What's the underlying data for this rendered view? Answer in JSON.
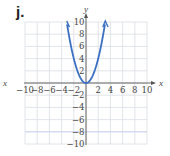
{
  "problem_label": "j.",
  "chart_data": {
    "type": "line",
    "title": "",
    "function": "y = x^2",
    "xlabel": "x",
    "ylabel": "y",
    "xlim": [
      -10,
      10
    ],
    "ylim": [
      -10,
      10
    ],
    "grid": true,
    "x_ticks": [
      -10,
      -8,
      -6,
      -4,
      -2,
      2,
      4,
      6,
      8,
      10
    ],
    "y_ticks": [
      -10,
      -8,
      -6,
      -4,
      -2,
      2,
      4,
      6,
      8,
      10
    ],
    "x_tick_labels": [
      "−10",
      "−8",
      "−6",
      "−4",
      "−2",
      "2",
      "4",
      "6",
      "8",
      "10"
    ],
    "y_tick_labels": [
      "−10",
      "−8",
      "−6",
      "−4",
      "−2",
      "2",
      "4",
      "6",
      "8",
      "10"
    ],
    "series": [
      {
        "name": "parabola",
        "color": "#3a6fc4",
        "x": [
          -3.16,
          -3,
          -2.5,
          -2,
          -1.5,
          -1,
          -0.5,
          0,
          0.5,
          1,
          1.5,
          2,
          2.5,
          3,
          3.16
        ],
        "y": [
          10,
          9,
          6.25,
          4,
          2.25,
          1,
          0.25,
          0,
          0.25,
          1,
          2.25,
          4,
          6.25,
          9,
          10
        ],
        "arrows_at_ends": true
      }
    ]
  },
  "colors": {
    "curve": "#3a6fc4",
    "grid": "#d9dde3",
    "axis": "#555555"
  }
}
